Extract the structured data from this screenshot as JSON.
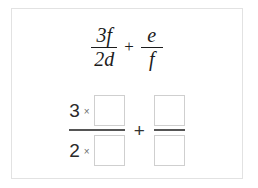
{
  "card": {
    "border_color": "#e2e2e2",
    "background": "#ffffff"
  },
  "given_expression": {
    "description": "3f over 2d plus e over f",
    "fraction1": {
      "numerator": "3f",
      "denominator": "2d"
    },
    "operator": "+",
    "fraction2": {
      "numerator": "e",
      "denominator": "f"
    }
  },
  "answer_expression": {
    "description": "3 times blank over 2 times blank, plus blank over blank",
    "fraction1": {
      "numerator_coefficient": "3",
      "numerator_times": "×",
      "numerator_value": "",
      "numerator_placeholder": "",
      "denominator_coefficient": "2",
      "denominator_times": "×",
      "denominator_value": "",
      "denominator_placeholder": ""
    },
    "operator": "+",
    "fraction2": {
      "numerator_value": "",
      "numerator_placeholder": "",
      "denominator_value": "",
      "denominator_placeholder": ""
    }
  }
}
